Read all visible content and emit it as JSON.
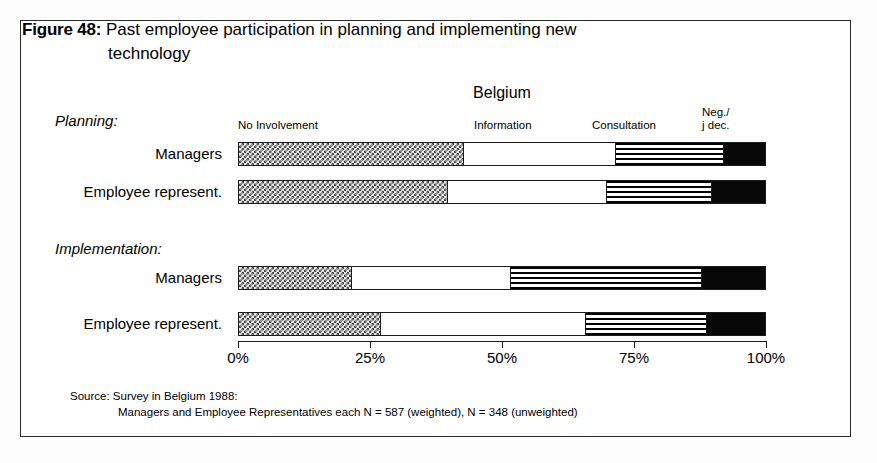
{
  "figure": {
    "label": "Figure 48:",
    "title_line1": "Past employee participation in planning and implementing new",
    "title_line2": "technology"
  },
  "chart_header": {
    "country": "Belgium",
    "columns": {
      "no_involvement": "No Involvement",
      "information": "Information",
      "consultation": "Consultation",
      "negotiation_line1": "Neg./",
      "negotiation_line2": "j dec."
    }
  },
  "groups": {
    "planning": "Planning:",
    "implementation": "Implementation:"
  },
  "rows": [
    {
      "label": "Managers",
      "group": "planning"
    },
    {
      "label": "Employee represent.",
      "group": "planning"
    },
    {
      "label": "Managers",
      "group": "implementation"
    },
    {
      "label": "Employee represent.",
      "group": "implementation"
    }
  ],
  "axis": {
    "ticks": [
      "0%",
      "25%",
      "50%",
      "75%",
      "100%"
    ],
    "tick_values": [
      0,
      25,
      50,
      75,
      100
    ]
  },
  "source": {
    "line1": "Source: Survey in Belgium 1988:",
    "line2": "Managers and Employee Representatives each N = 587 (weighted), N = 348 (unweighted)"
  },
  "colors": {
    "frame": "#2b2b2b",
    "bar_outline": "#1a1a1a",
    "no_involvement_fill": "#e9e9e9",
    "information_fill": "#ffffff",
    "consultation_fill": "#ffffff",
    "negotiation_fill": "#080808",
    "page_background": "#ffffff"
  },
  "chart_data": {
    "type": "bar",
    "orientation": "horizontal",
    "stacked": true,
    "percent": true,
    "title": "Past employee participation in planning and implementing new technology",
    "subtitle": "Belgium",
    "xlabel": "",
    "ylabel": "",
    "xlim": [
      0,
      100
    ],
    "grid": false,
    "legend_position": "top",
    "categories": [
      "Planning: Managers",
      "Planning: Employee represent.",
      "Implementation: Managers",
      "Implementation: Employee represent."
    ],
    "series": [
      {
        "name": "No Involvement",
        "values": [
          42.7,
          39.8,
          21.4,
          27.0
        ]
      },
      {
        "name": "Information",
        "values": [
          28.9,
          30.2,
          30.4,
          39.0
        ]
      },
      {
        "name": "Consultation",
        "values": [
          20.6,
          20.0,
          36.2,
          23.0
        ]
      },
      {
        "name": "Neg./ j dec.",
        "values": [
          7.8,
          10.0,
          12.0,
          11.0
        ]
      }
    ],
    "annotations": [
      "Source: Survey in Belgium 1988:",
      "Managers and Employee Representatives each N = 587 (weighted), N = 348 (unweighted)"
    ]
  }
}
